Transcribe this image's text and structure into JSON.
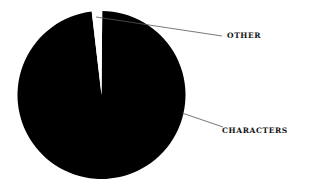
{
  "chart_data": {
    "type": "pie",
    "title": "",
    "categories": [
      "CHARACTERS",
      "OTHER"
    ],
    "values": [
      98,
      2
    ],
    "colors": [
      "#000000",
      "#ffffff"
    ],
    "legend": "none",
    "labels_position": "outside with leader lines",
    "start_angle_deg": -8,
    "geometry": {
      "cx": 101.5,
      "cy": 95,
      "r": 84
    }
  },
  "labels": {
    "other": "OTHER",
    "characters": "CHARACTERS"
  }
}
